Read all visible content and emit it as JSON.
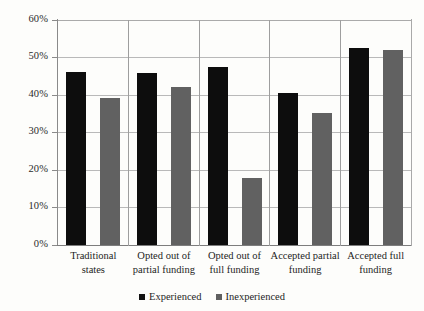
{
  "chart_data": {
    "type": "bar",
    "title": "",
    "xlabel": "",
    "ylabel": "",
    "ylim": [
      0,
      60
    ],
    "ytick_step": 10,
    "grid": true,
    "legend_position": "bottom",
    "value_suffix": "%",
    "categories": [
      "Traditional states",
      "Opted out of partial funding",
      "Opted out of full funding",
      "Accepted partial funding",
      "Accepted full funding"
    ],
    "category_lines": [
      [
        "Traditional",
        "states"
      ],
      [
        "Opted out of",
        "partial funding"
      ],
      [
        "Opted out of",
        "full funding"
      ],
      [
        "Accepted partial",
        "funding"
      ],
      [
        "Accepted full",
        "funding"
      ]
    ],
    "ytick_labels": [
      "0%",
      "10%",
      "20%",
      "30%",
      "40%",
      "50%",
      "60%"
    ],
    "ytick_values": [
      0,
      10,
      20,
      30,
      40,
      50,
      60
    ],
    "series": [
      {
        "name": "Experienced",
        "color": "#0d0d0d",
        "values": [
          46.2,
          46.0,
          47.5,
          40.6,
          52.6
        ]
      },
      {
        "name": "Inexperienced",
        "color": "#616161",
        "values": [
          39.2,
          42.1,
          17.8,
          35.3,
          52.1
        ]
      }
    ]
  },
  "legend": {
    "items": [
      {
        "label": "Experienced",
        "swatch": "black-square-icon"
      },
      {
        "label": "Inexperienced",
        "swatch": "gray-square-icon"
      }
    ]
  }
}
